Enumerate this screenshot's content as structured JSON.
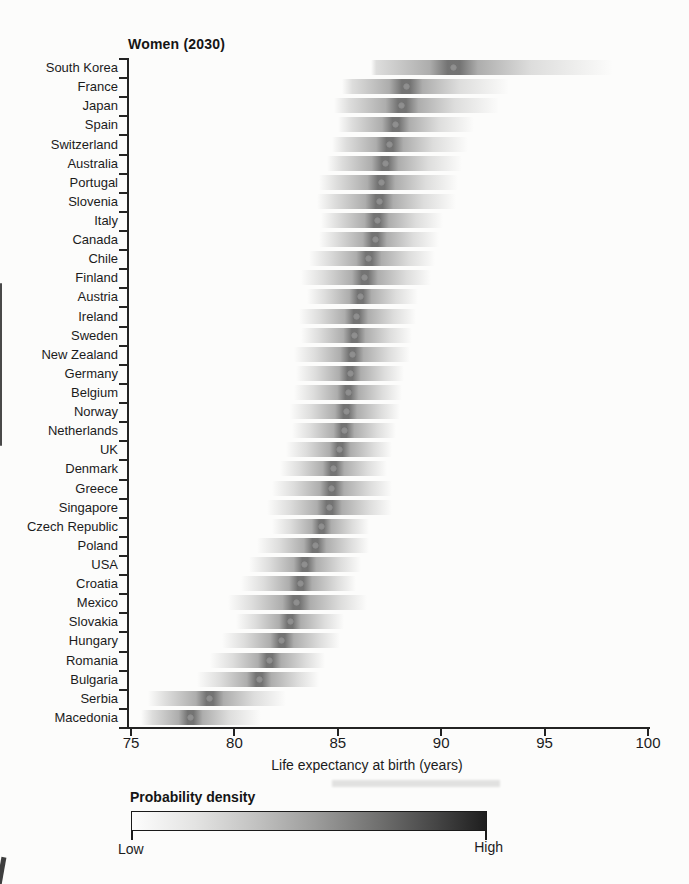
{
  "figure": {
    "kind": "scanned journal figure, density-strip chart",
    "background": "#fcfcfb"
  },
  "legend": {
    "title": "Probability density",
    "low_label": "Low",
    "high_label": "High",
    "gradient_start_color": "#ffffff",
    "gradient_end_color": "#1e1e1e"
  },
  "chart_data": {
    "type": "area",
    "subtype": "horizontal probability-density strips with median dot per country",
    "title": "Women (2030)",
    "xlabel": "Life expectancy at birth (years)",
    "xlim": [
      75,
      100
    ],
    "x_ticks": [
      75,
      80,
      85,
      90,
      95,
      100
    ],
    "grid": "off",
    "legend_position": "below, gradient colorbar Low to High",
    "colors": {
      "text": "#1c1c1c",
      "axis": "#232323",
      "band": "#2d2d2d",
      "median_dot": "#8f8f8f"
    },
    "countries": [
      {
        "name": "South Korea",
        "median": 90.6,
        "low": 86.6,
        "high": 98.3
      },
      {
        "name": "France",
        "median": 88.3,
        "low": 85.2,
        "high": 93.3
      },
      {
        "name": "Japan",
        "median": 88.1,
        "low": 84.8,
        "high": 92.8
      },
      {
        "name": "Spain",
        "median": 87.8,
        "low": 85.0,
        "high": 91.6
      },
      {
        "name": "Switzerland",
        "median": 87.5,
        "low": 84.7,
        "high": 91.3
      },
      {
        "name": "Australia",
        "median": 87.3,
        "low": 84.5,
        "high": 91.0
      },
      {
        "name": "Portugal",
        "median": 87.1,
        "low": 84.1,
        "high": 90.8
      },
      {
        "name": "Slovenia",
        "median": 87.0,
        "low": 84.0,
        "high": 90.7
      },
      {
        "name": "Italy",
        "median": 86.9,
        "low": 84.2,
        "high": 90.1
      },
      {
        "name": "Canada",
        "median": 86.8,
        "low": 84.1,
        "high": 89.9
      },
      {
        "name": "Chile",
        "median": 86.5,
        "low": 83.6,
        "high": 89.7
      },
      {
        "name": "Finland",
        "median": 86.3,
        "low": 83.2,
        "high": 89.5
      },
      {
        "name": "Austria",
        "median": 86.1,
        "low": 83.5,
        "high": 88.9
      },
      {
        "name": "Ireland",
        "median": 85.9,
        "low": 83.1,
        "high": 88.8
      },
      {
        "name": "Sweden",
        "median": 85.8,
        "low": 83.2,
        "high": 88.6
      },
      {
        "name": "New Zealand",
        "median": 85.7,
        "low": 82.9,
        "high": 88.5
      },
      {
        "name": "Germany",
        "median": 85.6,
        "low": 83.0,
        "high": 88.2
      },
      {
        "name": "Belgium",
        "median": 85.5,
        "low": 82.9,
        "high": 88.1
      },
      {
        "name": "Norway",
        "median": 85.4,
        "low": 82.7,
        "high": 88.0
      },
      {
        "name": "Netherlands",
        "median": 85.3,
        "low": 82.8,
        "high": 87.8
      },
      {
        "name": "UK",
        "median": 85.1,
        "low": 82.5,
        "high": 87.6
      },
      {
        "name": "Denmark",
        "median": 84.8,
        "low": 82.2,
        "high": 87.4
      },
      {
        "name": "Greece",
        "median": 84.7,
        "low": 81.8,
        "high": 87.6
      },
      {
        "name": "Singapore",
        "median": 84.6,
        "low": 81.6,
        "high": 87.6
      },
      {
        "name": "Czech Republic",
        "median": 84.2,
        "low": 81.8,
        "high": 86.5
      },
      {
        "name": "Poland",
        "median": 83.9,
        "low": 81.1,
        "high": 86.5
      },
      {
        "name": "USA",
        "median": 83.4,
        "low": 80.7,
        "high": 86.1
      },
      {
        "name": "Croatia",
        "median": 83.2,
        "low": 80.3,
        "high": 85.9
      },
      {
        "name": "Mexico",
        "median": 83.0,
        "low": 79.7,
        "high": 86.4
      },
      {
        "name": "Slovakia",
        "median": 82.7,
        "low": 80.1,
        "high": 85.3
      },
      {
        "name": "Hungary",
        "median": 82.3,
        "low": 79.4,
        "high": 85.1
      },
      {
        "name": "Romania",
        "median": 81.7,
        "low": 78.8,
        "high": 84.4
      },
      {
        "name": "Bulgaria",
        "median": 81.2,
        "low": 78.2,
        "high": 84.1
      },
      {
        "name": "Serbia",
        "median": 78.8,
        "low": 75.8,
        "high": 82.5
      },
      {
        "name": "Macedonia",
        "median": 77.9,
        "low": 75.5,
        "high": 81.3
      }
    ]
  }
}
